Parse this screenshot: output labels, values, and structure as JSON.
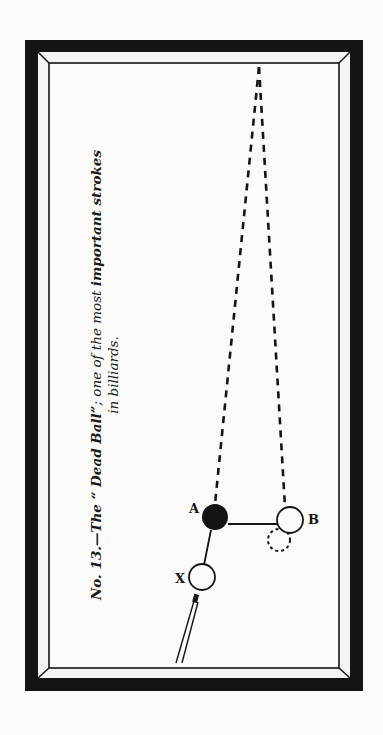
{
  "figure": {
    "number_label": "No. 13.",
    "title_prefix": "—The ",
    "title_quote": "“ Dead Ball”",
    "title_rest": "; one of the most ",
    "title_emph": "important strokes",
    "title_line2": "in billiards."
  },
  "diagram": {
    "balls": [
      {
        "id": "A",
        "label": "A",
        "filled": true,
        "cx": 215,
        "cy": 517
      },
      {
        "id": "B",
        "label": "B",
        "filled": false,
        "cx": 290,
        "cy": 520
      },
      {
        "id": "X",
        "label": "X",
        "filled": false,
        "cx": 202,
        "cy": 577
      }
    ],
    "ghost_ball": {
      "cx": 279,
      "cy": 540
    },
    "colors": {
      "ink": "#141414",
      "paper": "#fbfbfa",
      "cushion": "#f4f4f2"
    }
  }
}
